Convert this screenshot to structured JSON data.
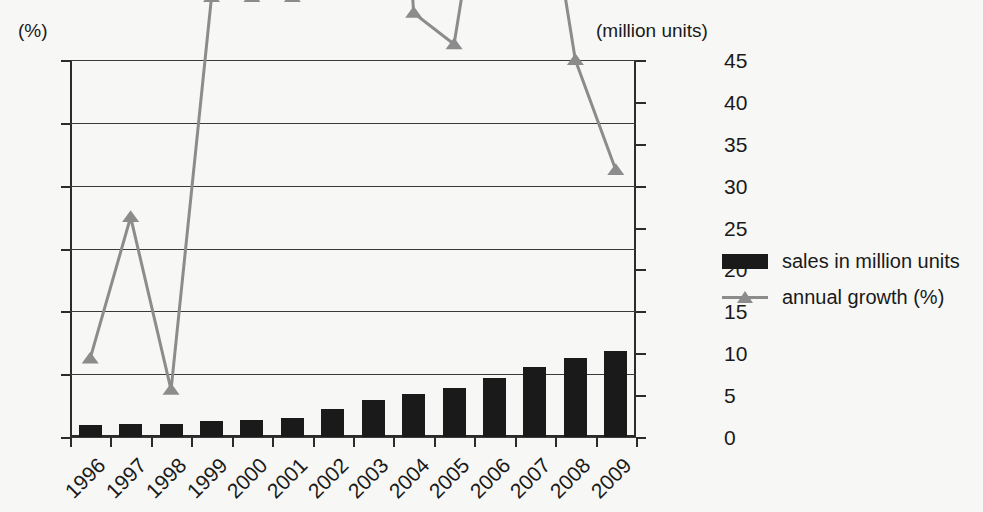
{
  "chart_data": {
    "type": "bar",
    "title": "",
    "categories": [
      "1996",
      "1997",
      "1998",
      "1999",
      "2000",
      "2001",
      "2002",
      "2003",
      "2004",
      "2005",
      "2006",
      "2007",
      "2008",
      "2009"
    ],
    "xlabel": "",
    "grid": true,
    "legend_position": "right",
    "left_axis": {
      "label": "(%)",
      "ticks": [
        "0",
        "2",
        "4",
        "6",
        "8",
        "10",
        "12"
      ],
      "values": [
        0,
        2,
        4,
        6,
        8,
        10,
        12
      ],
      "ylim": [
        0,
        12
      ]
    },
    "right_axis": {
      "label": "(million units)",
      "ticks": [
        "0",
        "5",
        "10",
        "15",
        "20",
        "25",
        "30",
        "35",
        "40",
        "45"
      ],
      "values": [
        0,
        5,
        10,
        15,
        20,
        25,
        30,
        35,
        40,
        45
      ],
      "ylim": [
        0,
        45
      ]
    },
    "series": [
      {
        "name": "sales in million units",
        "type": "bar",
        "axis": "right",
        "color": "#1a1a1a",
        "values": [
          1.4,
          1.6,
          1.6,
          1.9,
          2.05,
          2.3,
          3.3,
          4.45,
          5.1,
          5.8,
          7.0,
          8.4,
          9.4,
          10.25
        ]
      },
      {
        "name": "annual growth (%)",
        "type": "line",
        "axis": "left",
        "color": "#8c8c8c",
        "values": [
          2.5,
          7.0,
          1.5,
          14.0,
          14.0,
          14.0,
          40.0,
          34.0,
          13.5,
          12.5,
          20.5,
          20.0,
          12.0,
          8.5
        ]
      }
    ],
    "legend": [
      {
        "label": "sales in million units",
        "marker": "bar-swatch"
      },
      {
        "label": "annual growth (%)",
        "marker": "line-triangle-swatch"
      }
    ]
  }
}
